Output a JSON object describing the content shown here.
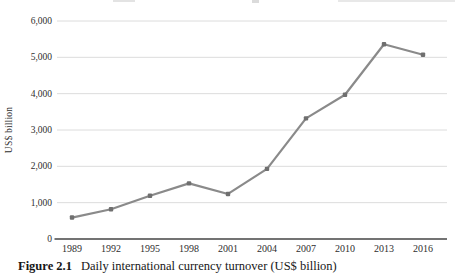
{
  "figure": {
    "caption_label": "Figure 2.1",
    "caption_text": "Daily international currency turnover (US$ billion)"
  },
  "chart_data": {
    "type": "line",
    "title": "",
    "xlabel": "",
    "ylabel": "US$ billion",
    "categories": [
      "1989",
      "1992",
      "1995",
      "1998",
      "2001",
      "2004",
      "2007",
      "2010",
      "2013",
      "2016"
    ],
    "series": [
      {
        "name": "Daily international currency turnover",
        "values": [
          590,
          820,
          1190,
          1530,
          1240,
          1930,
          3320,
          3970,
          5360,
          5070
        ]
      }
    ],
    "ylim": [
      0,
      6000
    ],
    "yticks": [
      0,
      1000,
      2000,
      3000,
      4000,
      5000,
      6000
    ],
    "ytick_labels": [
      "0",
      "1,000",
      "2,000",
      "3,000",
      "4,000",
      "5,000",
      "6,000"
    ],
    "grid": true,
    "legend": false,
    "line_color": "#8a8a8a",
    "marker_color": "#6f6f6f",
    "grid_color": "#dcdcdc",
    "axis_color": "#454545",
    "text_color": "#2e2e2e"
  }
}
